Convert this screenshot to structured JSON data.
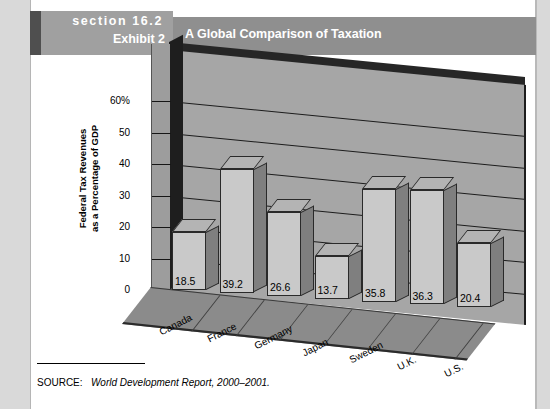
{
  "header": {
    "section_label": "section 16.2",
    "exhibit_label": "Exhibit 2",
    "title": "A Global Comparison of Taxation",
    "accent_color": "#4f4f4f",
    "section_block_color": "#a0a0a0",
    "titlebar_color": "#8f8f8f"
  },
  "source": {
    "prefix": "SOURCE:",
    "publication": "World Development Report, 2000–2001."
  },
  "chart_data": {
    "type": "bar",
    "title": "A Global Comparison of Taxation",
    "categories": [
      "Canada",
      "France",
      "Germany",
      "Japan",
      "Sweden",
      "U.K.",
      "U.S."
    ],
    "values": [
      18.5,
      39.2,
      26.6,
      13.7,
      35.8,
      36.3,
      20.4
    ],
    "value_labels": [
      "18.5",
      "39.2",
      "26.6",
      "13.7",
      "35.8",
      "36.3",
      "20.4"
    ],
    "xlabel": "",
    "ylabel": "Federal Tax Revenues as a Percentage of GDP",
    "ylabel_line1": "Federal Tax Revenues",
    "ylabel_line2": "as a Percentage of GDP",
    "ylim": [
      0,
      60
    ],
    "ytick_values": [
      0,
      10,
      20,
      30,
      40,
      50,
      60
    ],
    "ytick_labels": [
      "0",
      "10",
      "20",
      "30",
      "40",
      "50",
      "60%"
    ],
    "grid": true,
    "legend": "none",
    "style": "3d-column",
    "bar_face_color": "#c9c9c9",
    "bar_side_color": "#7f7f7f",
    "wall_color": "#a6a6a6",
    "floor_color": "#8b8b8b"
  }
}
